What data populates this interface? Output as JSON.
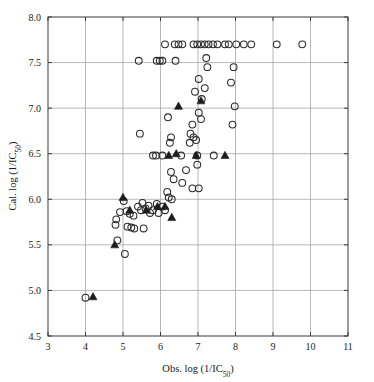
{
  "chart_data": {
    "type": "scatter",
    "title": "",
    "xlabel": "Obs. log (1/IC50)",
    "ylabel": "Cal. log (1/IC50)",
    "xlabel_main": "Obs. log (1/IC",
    "xlabel_sub": "50",
    "xlabel_tail": ")",
    "ylabel_main": "Cal. log (1/IC",
    "ylabel_sub": "50",
    "ylabel_tail": ")",
    "xlim": [
      3,
      11
    ],
    "ylim": [
      4.5,
      8.0
    ],
    "xticks": [
      3,
      4,
      5,
      6,
      7,
      8,
      9,
      10,
      11
    ],
    "xticklabels": [
      "3",
      "4",
      "5",
      "6",
      "7",
      "8",
      "9",
      "10",
      "11"
    ],
    "yticks": [
      4.5,
      5.0,
      5.5,
      6.0,
      6.5,
      7.0,
      7.5,
      8.0
    ],
    "yticklabels": [
      "4.5",
      "5.0",
      "5.5",
      "6.0",
      "6.5",
      "7.0",
      "7.5",
      "8.0"
    ],
    "grid": true,
    "grid_color": "#9a9a9a",
    "frame_color": "#3a3a3a",
    "legend": [],
    "series": [
      {
        "name": "training-set",
        "marker": "open-circle",
        "color": "#2b2b2b",
        "points": [
          [
            4.0,
            4.92
          ],
          [
            4.85,
            5.55
          ],
          [
            5.05,
            5.4
          ],
          [
            5.02,
            5.98
          ],
          [
            4.92,
            5.86
          ],
          [
            4.82,
            5.78
          ],
          [
            4.8,
            5.72
          ],
          [
            5.1,
            5.87
          ],
          [
            5.18,
            5.84
          ],
          [
            5.28,
            5.82
          ],
          [
            5.12,
            5.7
          ],
          [
            5.22,
            5.69
          ],
          [
            5.3,
            5.68
          ],
          [
            5.55,
            5.68
          ],
          [
            5.4,
            5.92
          ],
          [
            5.48,
            5.88
          ],
          [
            5.6,
            5.9
          ],
          [
            5.52,
            5.96
          ],
          [
            5.68,
            5.93
          ],
          [
            5.72,
            5.85
          ],
          [
            5.8,
            5.88
          ],
          [
            5.9,
            5.95
          ],
          [
            5.95,
            5.85
          ],
          [
            6.05,
            5.92
          ],
          [
            6.12,
            5.88
          ],
          [
            6.22,
            6.02
          ],
          [
            6.18,
            6.08
          ],
          [
            6.3,
            6.0
          ],
          [
            6.28,
            6.3
          ],
          [
            6.35,
            6.22
          ],
          [
            6.05,
            6.48
          ],
          [
            5.88,
            6.48
          ],
          [
            5.8,
            6.48
          ],
          [
            6.55,
            6.48
          ],
          [
            5.45,
            6.72
          ],
          [
            6.2,
            6.9
          ],
          [
            6.28,
            6.68
          ],
          [
            6.25,
            6.62
          ],
          [
            5.42,
            7.52
          ],
          [
            5.9,
            7.52
          ],
          [
            5.98,
            7.52
          ],
          [
            6.05,
            7.52
          ],
          [
            6.4,
            7.52
          ],
          [
            6.92,
            7.18
          ],
          [
            7.1,
            7.1
          ],
          [
            7.02,
            6.95
          ],
          [
            7.08,
            6.88
          ],
          [
            6.85,
            6.82
          ],
          [
            6.8,
            6.72
          ],
          [
            6.88,
            6.68
          ],
          [
            6.78,
            6.62
          ],
          [
            6.95,
            6.65
          ],
          [
            7.25,
            7.45
          ],
          [
            7.02,
            7.32
          ],
          [
            7.18,
            7.22
          ],
          [
            7.22,
            7.55
          ],
          [
            6.98,
            6.38
          ],
          [
            7.42,
            6.48
          ],
          [
            6.68,
            6.32
          ],
          [
            6.58,
            6.18
          ],
          [
            6.85,
            6.12
          ],
          [
            7.02,
            6.12
          ],
          [
            6.98,
            6.48
          ],
          [
            7.98,
            7.02
          ],
          [
            7.92,
            6.82
          ],
          [
            7.88,
            7.28
          ],
          [
            7.95,
            7.45
          ],
          [
            7.72,
            7.7
          ],
          [
            7.52,
            7.7
          ],
          [
            7.4,
            7.7
          ],
          [
            7.28,
            7.7
          ],
          [
            7.18,
            7.7
          ],
          [
            7.08,
            7.7
          ],
          [
            6.98,
            7.7
          ],
          [
            6.88,
            7.7
          ],
          [
            6.58,
            7.7
          ],
          [
            6.48,
            7.7
          ],
          [
            6.38,
            7.7
          ],
          [
            6.12,
            7.7
          ],
          [
            9.1,
            7.7
          ],
          [
            9.78,
            7.7
          ],
          [
            8.42,
            7.7
          ],
          [
            8.22,
            7.7
          ],
          [
            8.02,
            7.7
          ],
          [
            7.82,
            7.7
          ]
        ]
      },
      {
        "name": "test-set",
        "marker": "filled-triangle",
        "color": "#1c1c1c",
        "points": [
          [
            4.2,
            4.93
          ],
          [
            4.78,
            5.5
          ],
          [
            5.0,
            6.02
          ],
          [
            5.18,
            5.88
          ],
          [
            5.62,
            5.88
          ],
          [
            5.92,
            5.92
          ],
          [
            6.12,
            5.92
          ],
          [
            6.3,
            5.8
          ],
          [
            6.42,
            6.5
          ],
          [
            6.48,
            7.02
          ],
          [
            7.08,
            7.08
          ],
          [
            7.72,
            6.48
          ],
          [
            6.95,
            6.48
          ],
          [
            6.22,
            6.48
          ]
        ]
      }
    ],
    "geometry": {
      "plot_left": 48,
      "plot_right": 348,
      "plot_top": 17,
      "plot_bottom": 336,
      "marker_radius": 3.4,
      "triangle_size": 4.0
    }
  }
}
